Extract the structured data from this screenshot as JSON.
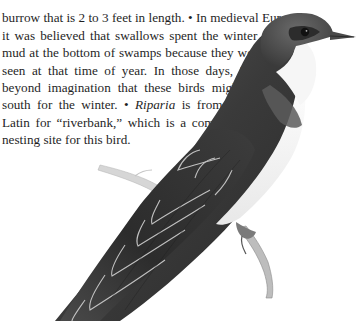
{
  "page": {
    "body_paragraph": {
      "lines": [
        "tunnel or burrow...",
        "burrow that is 2 to 3 feet in length. • In medieval Europe,",
        "it was believed that swallows spent the winter in the",
        "mud at the bottom of swamps because they were not",
        "seen at that time of year. In those days, it was",
        "beyond imagination that these birds might fly",
        "south for the winter. • ",
        "Latin for “riverbank,” which is a common",
        "nesting site for this bird."
      ],
      "italic_term": "Riparia",
      "after_italic": " is from the"
    },
    "illustration": {
      "subject": "Bank Swallow perched on a twig",
      "colors": {
        "upperparts": "#3a3a3a",
        "wing_dark": "#2b2b2b",
        "feather_edges": "#cfcfcf",
        "underparts": "#f4f4f4",
        "twig": "#9a9a9a"
      }
    }
  }
}
